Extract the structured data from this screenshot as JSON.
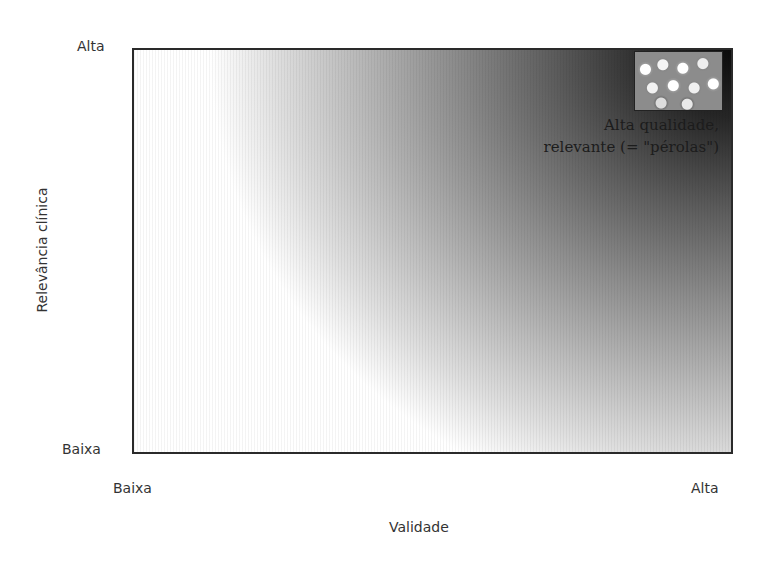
{
  "diagram": {
    "y_axis": {
      "label": "Relevância clínica",
      "high": "Alta",
      "low": "Baixa"
    },
    "x_axis": {
      "label": "Validade",
      "low": "Baixa",
      "high": "Alta"
    },
    "annotation": {
      "line1": "Alta qualidade,",
      "line2": "relevante (= \"pérolas\")"
    },
    "image_icon": "pearls-image"
  }
}
